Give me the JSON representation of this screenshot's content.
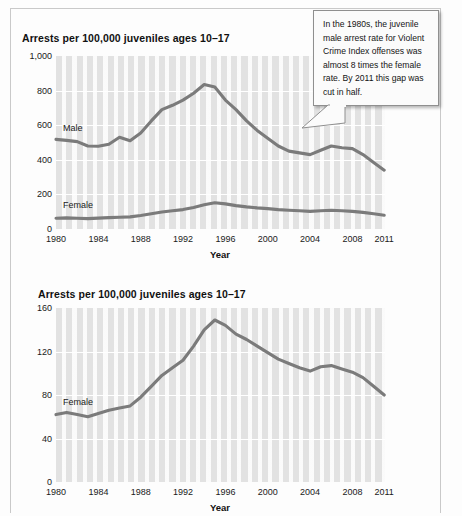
{
  "callout": {
    "text": "In the 1980s, the juvenile male arrest rate for Violent Crime Index offenses was almost 8 times the female rate. By 2011 this gap was cut in half."
  },
  "charts": [
    {
      "id": "top",
      "title": "Arrests per 100,000 juveniles ages 10–17",
      "xlabel": "Year",
      "ylabel": "",
      "yticks": [
        "1,000",
        "800",
        "600",
        "400",
        "200",
        "0"
      ],
      "xticks": [
        "1980",
        "1984",
        "1988",
        "1992",
        "1996",
        "2000",
        "2004",
        "2008",
        "2011"
      ],
      "series_labels": [
        "Male",
        "Female"
      ]
    },
    {
      "id": "bottom",
      "title": "Arrests per 100,000 juveniles ages 10–17",
      "xlabel": "Year",
      "ylabel": "",
      "yticks": [
        "160",
        "120",
        "80",
        "40",
        "0"
      ],
      "xticks": [
        "1980",
        "1984",
        "1988",
        "1992",
        "1996",
        "2000",
        "2004",
        "2008",
        "2011"
      ],
      "series_labels": [
        "Female"
      ]
    }
  ],
  "chart_data": [
    {
      "type": "line",
      "title": "Arrests per 100,000 juveniles ages 10–17",
      "subtitle": "Juvenile Violent Crime Index arrest rate by sex, 1980–2011",
      "xlabel": "Year",
      "ylabel": "Arrests per 100,000 juveniles ages 10–17",
      "xlim": [
        1980,
        2011
      ],
      "ylim": [
        0,
        1000
      ],
      "ytick_values": [
        0,
        200,
        400,
        600,
        800,
        1000
      ],
      "ytick_labels": [
        "0",
        "200",
        "400",
        "600",
        "800",
        "1,000"
      ],
      "xtick_values": [
        1980,
        1984,
        1988,
        1992,
        1996,
        2000,
        2004,
        2008,
        2011
      ],
      "xtick_labels": [
        "1980",
        "1984",
        "1988",
        "1992",
        "1996",
        "2000",
        "2004",
        "2008",
        "2011"
      ],
      "grid": "horizontal-white-on-gray, vertical white stripes per year",
      "legend": "inline series labels on plot",
      "x": [
        1980,
        1981,
        1982,
        1983,
        1984,
        1985,
        1986,
        1987,
        1988,
        1989,
        1990,
        1991,
        1992,
        1993,
        1994,
        1995,
        1996,
        1997,
        1998,
        1999,
        2000,
        2001,
        2002,
        2003,
        2004,
        2005,
        2006,
        2007,
        2008,
        2009,
        2010,
        2011
      ],
      "series": [
        {
          "name": "Male",
          "label_position": {
            "x": 1981.5,
            "y": 590
          },
          "values": [
            518,
            512,
            505,
            480,
            478,
            490,
            530,
            510,
            555,
            625,
            690,
            715,
            745,
            785,
            835,
            820,
            745,
            690,
            625,
            570,
            525,
            480,
            450,
            440,
            430,
            455,
            480,
            470,
            465,
            430,
            385,
            340
          ]
        },
        {
          "name": "Female",
          "label_position": {
            "x": 1981.5,
            "y": 185
          },
          "values": [
            62,
            64,
            62,
            60,
            63,
            66,
            68,
            70,
            78,
            88,
            98,
            105,
            112,
            125,
            140,
            152,
            145,
            135,
            128,
            122,
            118,
            112,
            108,
            105,
            102,
            105,
            108,
            105,
            102,
            96,
            88,
            80
          ]
        }
      ]
    },
    {
      "type": "line",
      "title": "Arrests per 100,000 juveniles ages 10–17",
      "subtitle": "Juvenile female Violent Crime Index arrest rate, 1980–2011 (rescaled)",
      "xlabel": "Year",
      "ylabel": "Arrests per 100,000 juveniles ages 10–17",
      "xlim": [
        1980,
        2011
      ],
      "ylim": [
        0,
        160
      ],
      "ytick_values": [
        0,
        40,
        80,
        120,
        160
      ],
      "ytick_labels": [
        "0",
        "40",
        "80",
        "120",
        "160"
      ],
      "xtick_values": [
        1980,
        1984,
        1988,
        1992,
        1996,
        2000,
        2004,
        2008,
        2011
      ],
      "xtick_labels": [
        "1980",
        "1984",
        "1988",
        "1992",
        "1996",
        "2000",
        "2004",
        "2008",
        "2011"
      ],
      "grid": "horizontal-white-on-gray, vertical white stripes per year",
      "legend": "inline series label on plot",
      "x": [
        1980,
        1981,
        1982,
        1983,
        1984,
        1985,
        1986,
        1987,
        1988,
        1989,
        1990,
        1991,
        1992,
        1993,
        1994,
        1995,
        1996,
        1997,
        1998,
        1999,
        2000,
        2001,
        2002,
        2003,
        2004,
        2005,
        2006,
        2007,
        2008,
        2009,
        2010,
        2011
      ],
      "series": [
        {
          "name": "Female",
          "label_position": {
            "x": 1981.8,
            "y": 74
          },
          "values": [
            62,
            64,
            62,
            60,
            63,
            66,
            68,
            70,
            78,
            88,
            98,
            105,
            112,
            125,
            140,
            149,
            144,
            136,
            131,
            125,
            119,
            113,
            109,
            105,
            102,
            106,
            107,
            104,
            101,
            96,
            88,
            80
          ]
        }
      ]
    }
  ],
  "colors": {
    "line": "#7b7b7b",
    "plot_background": "#e2e2e2",
    "gridline": "#ffffff",
    "text": "#1a1a1a",
    "callout_border": "#8f8f8f",
    "callout_background": "#fbfbfb"
  }
}
